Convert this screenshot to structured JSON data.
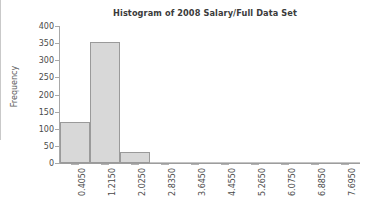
{
  "chart_data": {
    "type": "bar",
    "title": "Histogram of 2008 Salary/Full Data Set",
    "xlabel": "",
    "ylabel": "Frequency",
    "ylim": [
      0,
      400
    ],
    "ytick_labels": [
      "400",
      "350",
      "300",
      "250",
      "200",
      "150",
      "100",
      "50",
      "0"
    ],
    "ytick_values": [
      400,
      350,
      300,
      250,
      200,
      150,
      100,
      50,
      0
    ],
    "ytick_step": 50,
    "grid": false,
    "legend": "none",
    "categories": [
      "0.4050",
      "1.2150",
      "2.0250",
      "2.8350",
      "3.6450",
      "4.4550",
      "5.2650",
      "6.0750",
      "6.8850",
      "7.6950"
    ],
    "values": [
      120,
      352,
      32,
      2,
      1,
      1,
      2,
      0,
      0,
      1
    ],
    "bar_color": "#d8d8d8",
    "bar_border_color": "#9a9a9a",
    "axis_color": "#9d9d9d",
    "text_color": "#4a4a4a",
    "title_color": "#3b3b3b",
    "background": "#ffffff"
  }
}
